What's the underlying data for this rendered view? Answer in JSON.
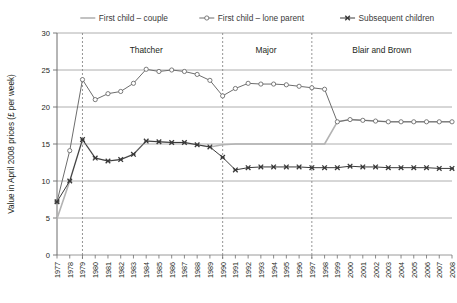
{
  "chart_data": {
    "type": "line",
    "title": "",
    "xlabel": "",
    "ylabel": "Value in April 2008 prices (£ per week)",
    "ylim": [
      0,
      30
    ],
    "yticks": [
      0,
      5,
      10,
      15,
      20,
      25,
      30
    ],
    "grid": true,
    "legend_position": "top",
    "x": [
      1977,
      1978,
      1979,
      1980,
      1981,
      1982,
      1983,
      1984,
      1985,
      1986,
      1987,
      1988,
      1989,
      1990,
      1991,
      1992,
      1993,
      1994,
      1995,
      1996,
      1997,
      1998,
      1999,
      2000,
      2001,
      2002,
      2003,
      2004,
      2005,
      2006,
      2007,
      2008
    ],
    "categories": [
      "1977",
      "1978",
      "1979",
      "1980",
      "1981",
      "1982",
      "1983",
      "1984",
      "1985",
      "1986",
      "1987",
      "1988",
      "1989",
      "1990",
      "1991",
      "1992",
      "1993",
      "1994",
      "1995",
      "1996",
      "1997",
      "1998",
      "1999",
      "2000",
      "2001",
      "2002",
      "2003",
      "2004",
      "2005",
      "2006",
      "2007",
      "2008"
    ],
    "series": [
      {
        "name": "First child – couple",
        "color": "#b3b3b3",
        "marker": "none",
        "values": [
          4.9,
          10.0,
          15.6,
          13.1,
          12.7,
          12.9,
          13.6,
          15.4,
          15.3,
          15.2,
          15.2,
          14.9,
          14.6,
          14.9,
          15.0,
          15.0,
          15.0,
          15.0,
          15.0,
          15.0,
          15.0,
          15.0,
          18.0,
          18.3,
          18.2,
          18.1,
          18.0,
          18.0,
          18.0,
          18.0,
          18.0,
          18.0
        ]
      },
      {
        "name": "First child – lone parent",
        "color": "#6d6d6d",
        "marker": "circle",
        "values": [
          7.2,
          14.1,
          23.7,
          21.0,
          21.8,
          22.1,
          23.2,
          25.1,
          24.8,
          25.0,
          24.8,
          24.4,
          23.6,
          21.5,
          22.5,
          23.2,
          23.1,
          23.1,
          23.0,
          22.8,
          22.6,
          22.4,
          18.0,
          18.3,
          18.2,
          18.1,
          18.0,
          18.0,
          18.0,
          18.0,
          18.0,
          18.0
        ]
      },
      {
        "name": "Subsequent children",
        "color": "#3a3a3a",
        "marker": "x",
        "values": [
          7.2,
          10.0,
          15.6,
          13.1,
          12.7,
          12.9,
          13.6,
          15.4,
          15.3,
          15.2,
          15.2,
          14.9,
          14.6,
          13.2,
          11.5,
          11.8,
          11.9,
          11.9,
          11.9,
          11.9,
          11.8,
          11.8,
          11.8,
          12.0,
          11.9,
          11.9,
          11.8,
          11.8,
          11.8,
          11.8,
          11.7,
          11.7
        ]
      }
    ],
    "annotations": [
      {
        "label": "Thatcher",
        "x": 1984.0,
        "y": 27.3
      },
      {
        "label": "Major",
        "x": 1993.4,
        "y": 27.3
      },
      {
        "label": "Blair and Brown",
        "x": 2002.5,
        "y": 27.3
      }
    ],
    "vlines": [
      1979,
      1990,
      1997
    ]
  },
  "legend": {
    "items": [
      {
        "label": "First child – couple",
        "marker": "line",
        "color": "#b3b3b3"
      },
      {
        "label": "First child – lone parent",
        "marker": "circle",
        "color": "#6d6d6d"
      },
      {
        "label": "Subsequent children",
        "marker": "x",
        "color": "#3a3a3a"
      }
    ]
  }
}
